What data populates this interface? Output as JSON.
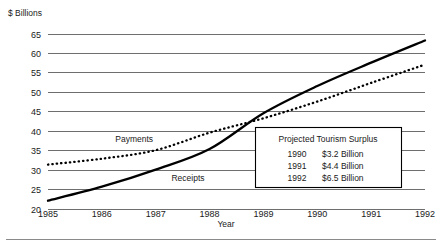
{
  "chart_data": {
    "type": "line",
    "title": "",
    "xlabel": "Year",
    "ylabel": "$ Billions",
    "grid": true,
    "legend_position": "inline-labels",
    "x": [
      1985,
      1986,
      1987,
      1988,
      1989,
      1990,
      1991,
      1992
    ],
    "xticklabels": [
      "1985",
      "1986",
      "1987",
      "1988",
      "1989",
      "1990",
      "1991",
      "1992"
    ],
    "xlim": [
      1985,
      1992
    ],
    "ylim": [
      20,
      65
    ],
    "yticks": [
      20,
      25,
      30,
      35,
      40,
      45,
      50,
      55,
      60,
      65
    ],
    "yticklabels": [
      "20",
      "25",
      "30",
      "35",
      "40",
      "45",
      "50",
      "55",
      "60",
      "65"
    ],
    "series": [
      {
        "name": "Receipts",
        "style": "solid",
        "color": "#000000",
        "values": [
          22.0,
          25.6,
          30.0,
          35.3,
          44.5,
          51.5,
          57.5,
          63.2
        ]
      },
      {
        "name": "Payments",
        "style": "dotted",
        "color": "#000000",
        "values": [
          31.3,
          32.8,
          35.0,
          39.5,
          43.2,
          47.5,
          52.3,
          57.0
        ]
      }
    ],
    "annotations": [
      {
        "text": "Payments",
        "x": 1986.6,
        "y": 37.2
      },
      {
        "text": "Receipts",
        "x": 1987.6,
        "y": 27.2
      }
    ]
  },
  "callout": {
    "title": "Projected Tourism Surplus",
    "rows": [
      {
        "year": "1990",
        "amount": "$3.2 Billion"
      },
      {
        "year": "1991",
        "amount": "$4.4 Billion"
      },
      {
        "year": "1992",
        "amount": "$6.5 Billion"
      }
    ]
  }
}
